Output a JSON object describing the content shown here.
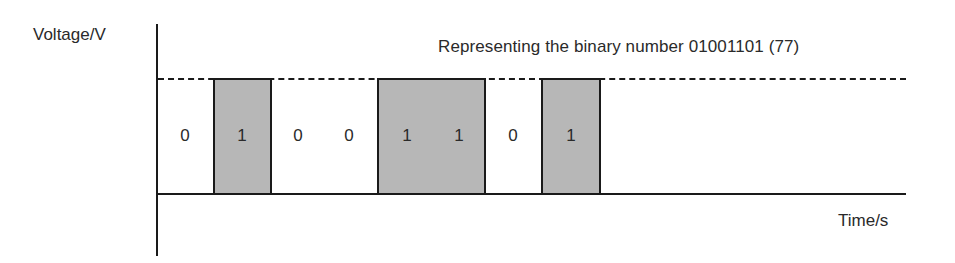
{
  "diagram": {
    "title": "Representing the binary number 01001101 (77)",
    "y_axis_label": "Voltage/V",
    "x_axis_label": "Time/s",
    "bits": [
      "0",
      "1",
      "0",
      "0",
      "1",
      "1",
      "0",
      "1"
    ],
    "colors": {
      "high_fill": "#b7b7b7",
      "line": "#1a1a1a",
      "text": "#2a2a2a"
    }
  }
}
